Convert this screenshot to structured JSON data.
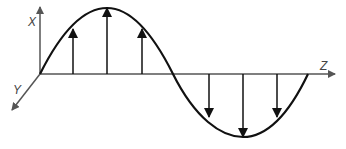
{
  "diagram": {
    "type": "transverse-wave",
    "axes": {
      "x_label": "X",
      "y_label": "Y",
      "z_label": "Z"
    },
    "wave": {
      "shape": "sine",
      "cycles": 1,
      "field_vectors_up": 3,
      "field_vectors_down": 3
    },
    "colors": {
      "stroke": "#111111",
      "axis": "#555555",
      "background": "#ffffff"
    }
  }
}
